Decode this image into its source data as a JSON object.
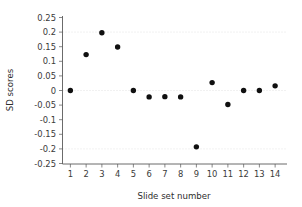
{
  "chart_data": {
    "type": "scatter",
    "title": "",
    "xlabel": "Slide set number",
    "ylabel": "SD scores",
    "x": [
      1,
      2,
      3,
      4,
      5,
      6,
      7,
      8,
      9,
      10,
      11,
      12,
      13,
      14
    ],
    "values": [
      0.0,
      0.123,
      0.198,
      0.149,
      0.0,
      -0.022,
      -0.021,
      -0.022,
      -0.193,
      0.027,
      -0.048,
      0.0,
      0.0,
      0.016
    ],
    "series": [
      {
        "name": "SD scores",
        "values": [
          0.0,
          0.123,
          0.198,
          0.149,
          0.0,
          -0.022,
          -0.021,
          -0.022,
          -0.193,
          0.027,
          -0.048,
          0.0,
          0.0,
          0.016
        ]
      }
    ],
    "xlim": [
      0.5,
      14.5
    ],
    "ylim": [
      -0.25,
      0.25
    ],
    "xtick_labels": [
      "1",
      "2",
      "3",
      "4",
      "5",
      "6",
      "7",
      "8",
      "9",
      "10",
      "11",
      "12",
      "13",
      "14"
    ],
    "ytick_labels": [
      "0.25",
      "0.2",
      "0.15",
      "0.1",
      "0.05",
      "0",
      "-0.05",
      "-0.1",
      "-0.15",
      "-0.2",
      "-0.25"
    ],
    "ytick_values": [
      0.25,
      0.2,
      0.15,
      0.1,
      0.05,
      0,
      -0.05,
      -0.1,
      -0.15,
      -0.2,
      -0.25
    ],
    "gridlines": [
      0.2,
      0.0,
      -0.2
    ],
    "grid": true,
    "legend": null,
    "marker": "filled-circle",
    "marker_color": "#101010",
    "background_color": "#ffffff",
    "axis_color": "#5a5a5a",
    "grid_color": "#d8d8d8"
  }
}
